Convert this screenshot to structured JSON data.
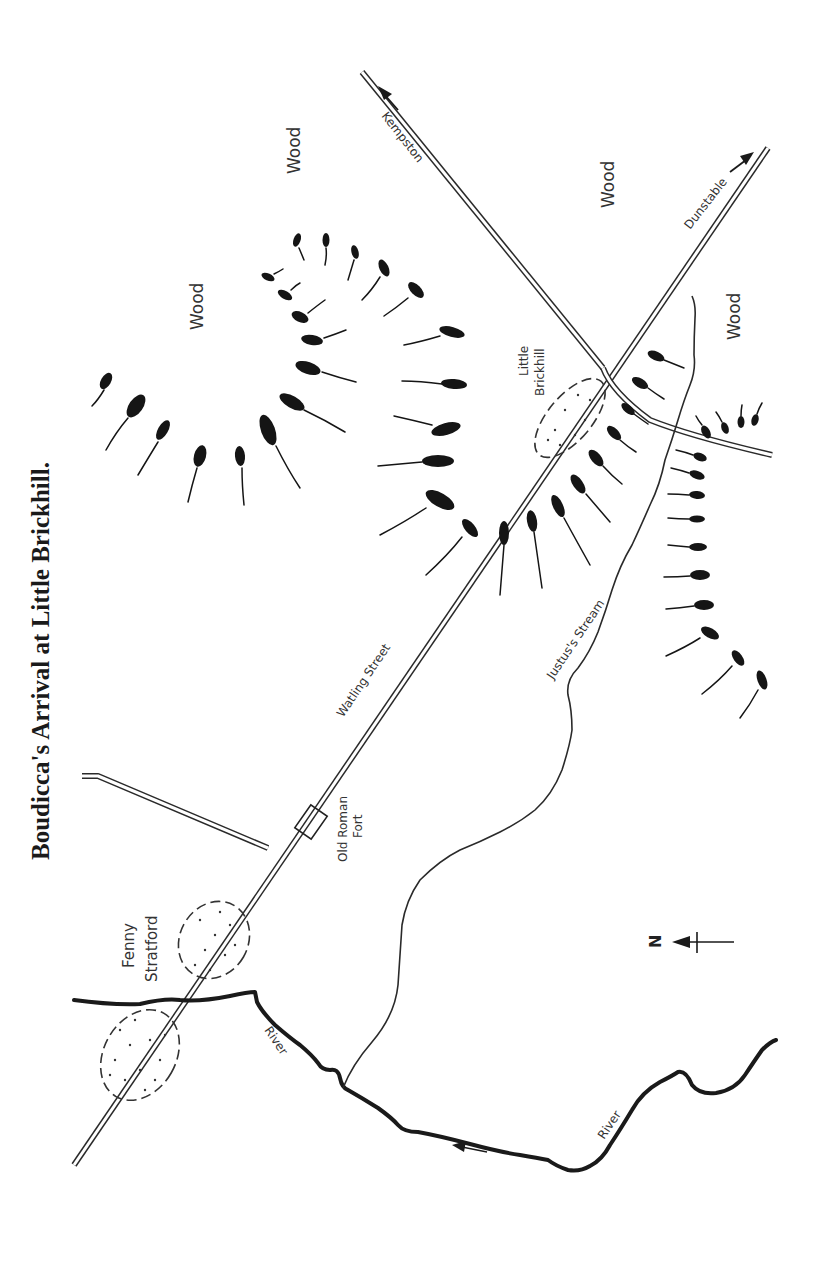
{
  "map": {
    "title": "Boudicca's Arrival at Little Brickhill.",
    "orientation": "rotated 90° clockwise (north points left)",
    "labels": {
      "fenny_stratford_line1": "Fenny",
      "fenny_stratford_line2": "Stratford",
      "little_brickhill_line1": "Little",
      "little_brickhill_line2": "Brickhill",
      "old_roman_fort_line1": "Old Roman",
      "old_roman_fort_line2": "Fort",
      "watling_street": "Watling Street",
      "justus_stream": "Justus's Stream",
      "river_upper": "River",
      "river_lower": "River",
      "kempston": "Kempston",
      "dunstable": "Dunstable",
      "wood_1": "Wood",
      "wood_2": "Wood",
      "wood_3": "Wood",
      "wood_4": "Wood",
      "north": "N"
    },
    "legend": {
      "north_arrow": "north-arrow-icon",
      "army_marker": "tadpole-army-marker",
      "settlement": "dotted-dashed-ellipse"
    },
    "colors": {
      "ink": "#1a1a1a",
      "paper": "#ffffff"
    }
  }
}
